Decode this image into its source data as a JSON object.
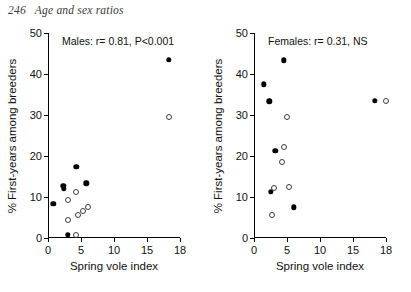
{
  "header": {
    "page_number": "246",
    "running_title": "Age and sex ratios"
  },
  "axes": {
    "xlabel": "Spring vole index",
    "ylabel": "% First-years among breeders",
    "x_ticks": [
      "0",
      "5",
      "10",
      "15",
      "18"
    ],
    "y_ticks": [
      "0",
      "10",
      "20",
      "30",
      "40",
      "50"
    ]
  },
  "panels": [
    {
      "id": "males",
      "annotation": "Males: r= 0.81, P<0.001"
    },
    {
      "id": "females",
      "annotation": "Females: r= 0.31, NS"
    }
  ],
  "chart_data": [
    {
      "type": "scatter",
      "title": "Males: r= 0.81, P<0.001",
      "xlabel": "Spring vole index",
      "ylabel": "% First-years among breeders",
      "xlim": [
        0,
        18
      ],
      "ylim": [
        0,
        50
      ],
      "x_ticks": [
        0,
        5,
        10,
        15,
        18
      ],
      "y_ticks": [
        0,
        10,
        20,
        30,
        40,
        50
      ],
      "grid": false,
      "legend": "none",
      "series": [
        {
          "name": "filled-circles",
          "marker": "filled circle",
          "points": [
            [
              0.8,
              8.3
            ],
            [
              2.3,
              12.8
            ],
            [
              2.4,
              12.0
            ],
            [
              3.0,
              0.8
            ],
            [
              4.3,
              17.3
            ],
            [
              5.8,
              13.3
            ],
            [
              17.0,
              43.5
            ]
          ]
        },
        {
          "name": "open-circles",
          "marker": "open circle",
          "points": [
            [
              3.0,
              9.3
            ],
            [
              3.1,
              4.5
            ],
            [
              4.2,
              11.3
            ],
            [
              4.3,
              0.7
            ],
            [
              4.6,
              5.7
            ],
            [
              5.3,
              6.5
            ],
            [
              6.0,
              7.5
            ],
            [
              17.0,
              29.5
            ]
          ]
        }
      ]
    },
    {
      "type": "scatter",
      "title": "Females: r= 0.31, NS",
      "xlabel": "Spring vole index",
      "ylabel": "% First-years among breeders",
      "xlim": [
        0,
        18
      ],
      "ylim": [
        0,
        50
      ],
      "x_ticks": [
        0,
        5,
        10,
        15,
        18
      ],
      "y_ticks": [
        0,
        10,
        20,
        30,
        40,
        50
      ],
      "grid": false,
      "legend": "none",
      "series": [
        {
          "name": "filled-circles",
          "marker": "filled circle",
          "points": [
            [
              1.5,
              37.5
            ],
            [
              2.3,
              33.3
            ],
            [
              2.5,
              11.2
            ],
            [
              3.2,
              21.3
            ],
            [
              4.5,
              43.3
            ],
            [
              6.0,
              7.5
            ],
            [
              17.0,
              33.5
            ]
          ]
        },
        {
          "name": "open-circles",
          "marker": "open circle",
          "points": [
            [
              2.8,
              5.5
            ],
            [
              3.0,
              12.3
            ],
            [
              4.3,
              18.5
            ],
            [
              4.5,
              22.3
            ],
            [
              5.0,
              29.5
            ],
            [
              5.3,
              12.5
            ],
            [
              18.0,
              33.5
            ]
          ]
        }
      ]
    }
  ]
}
